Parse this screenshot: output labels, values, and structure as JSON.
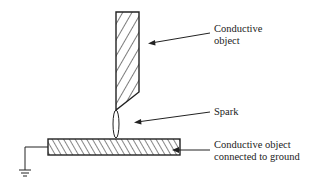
{
  "diagram": {
    "type": "electrostatic spark discharge illustration",
    "labels": {
      "upper_object": "Conductive\nobject",
      "spark": "Spark",
      "lower_object": "Conductive object\nconnected to ground"
    },
    "components": [
      {
        "id": "upper-conductor",
        "shape": "hatched vertical rod with tapered tip"
      },
      {
        "id": "spark",
        "shape": "ellipse between rod tip and plate"
      },
      {
        "id": "lower-conductor",
        "shape": "hatched horizontal plate"
      },
      {
        "id": "ground",
        "shape": "ground symbol connected to plate via wire"
      }
    ],
    "colors": {
      "stroke": "#222222",
      "background": "#ffffff"
    }
  }
}
